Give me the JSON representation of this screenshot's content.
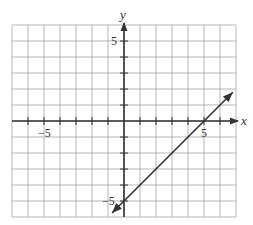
{
  "chart_data": {
    "type": "line",
    "title": "",
    "xlabel": "x",
    "ylabel": "y",
    "xlim": [
      -7,
      7
    ],
    "ylim": [
      -6,
      6
    ],
    "grid": true,
    "x_tick_labels": [
      {
        "value": -5,
        "label": "−5"
      },
      {
        "value": 5,
        "label": "5"
      }
    ],
    "y_tick_labels": [
      {
        "value": 5,
        "label": "5"
      },
      {
        "value": -5,
        "label": "−5"
      }
    ],
    "series": [
      {
        "name": "line",
        "equation": "y = x - 5",
        "slope": 1,
        "y_intercept": -5,
        "x_intercept": 5,
        "points": [
          [
            -0.75,
            -5.75
          ],
          [
            6.8,
            1.8
          ]
        ],
        "arrows_both_ends": true
      }
    ],
    "colors": {
      "grid": "#b5b5b5",
      "axis": "#333333",
      "line": "#333333"
    }
  },
  "labels": {
    "x_axis": "x",
    "y_axis": "y",
    "x_neg5": "−5",
    "x_pos5": "5",
    "y_pos5": "5",
    "y_neg5": "−5"
  }
}
